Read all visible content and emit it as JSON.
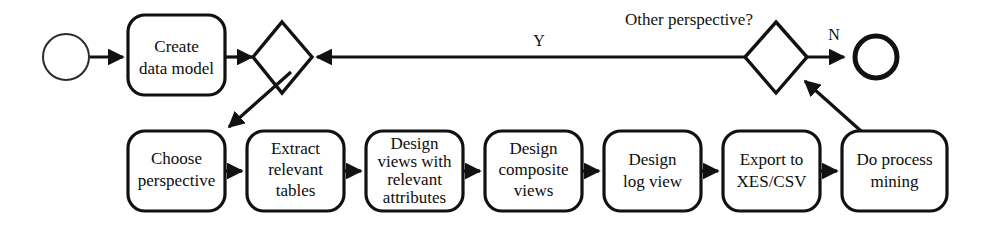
{
  "diagram": {
    "colors": {
      "stroke": "#111111",
      "background": "#ffffff",
      "text": "#0d0d0d"
    },
    "start_node": {
      "name": "start-event",
      "label": ""
    },
    "end_node": {
      "name": "end-event",
      "label": ""
    },
    "top_row": {
      "create_box": {
        "line1": "Create",
        "line2": "data model"
      },
      "left_gateway": {
        "label": ""
      },
      "right_gateway": {
        "label": ""
      },
      "question_label": "Other perspective?",
      "yes_label": "Y",
      "no_label": "N"
    },
    "bottom_row": [
      {
        "id": "choose-perspective",
        "lines": [
          "Choose",
          "perspective"
        ]
      },
      {
        "id": "extract-relevant-tables",
        "lines": [
          "Extract",
          "relevant",
          "tables"
        ]
      },
      {
        "id": "design-views-relevant-attributes",
        "lines": [
          "Design",
          "views with",
          "relevant",
          "attributes"
        ]
      },
      {
        "id": "design-composite-views",
        "lines": [
          "Design",
          "composite",
          "views"
        ]
      },
      {
        "id": "design-log-view",
        "lines": [
          "Design",
          "log view"
        ]
      },
      {
        "id": "export-xes-csv",
        "lines": [
          "Export to",
          "XES/CSV"
        ]
      },
      {
        "id": "do-process-mining",
        "lines": [
          "Do process",
          "mining"
        ]
      }
    ]
  }
}
